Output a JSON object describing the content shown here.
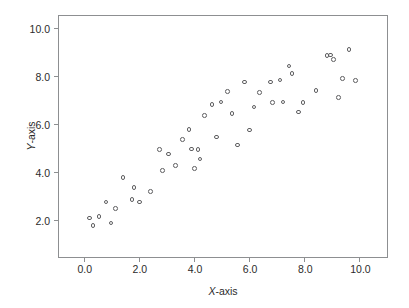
{
  "chart_data": {
    "type": "scatter",
    "title": "",
    "xlabel": "X-axis",
    "ylabel": "Y-axis",
    "xlim": [
      -0.9,
      11.0
    ],
    "ylim": [
      0.45,
      10.5
    ],
    "grid": false,
    "legend": null,
    "marker": {
      "shape": "open-circle",
      "edge_color": "#5e5e60",
      "fill": "none",
      "size_px": 4.6
    },
    "frame_color": "#8d8f91",
    "background": "#ffffff",
    "xticks": [
      0.0,
      2.0,
      4.0,
      6.0,
      8.0,
      10.0
    ],
    "xtick_labels": [
      "0.0",
      "2.0",
      "4.0",
      "6.0",
      "8.0",
      "10.0"
    ],
    "yticks": [
      2.0,
      4.0,
      6.0,
      8.0,
      10.0
    ],
    "ytick_labels": [
      "2.0",
      "4.0",
      "6.0",
      "8.0",
      "10.0"
    ],
    "n_points": 48,
    "points": [
      {
        "x": 0.2,
        "y": 2.08
      },
      {
        "x": 0.33,
        "y": 1.77
      },
      {
        "x": 0.55,
        "y": 2.15
      },
      {
        "x": 0.8,
        "y": 2.74
      },
      {
        "x": 0.98,
        "y": 1.86
      },
      {
        "x": 1.15,
        "y": 2.47
      },
      {
        "x": 1.42,
        "y": 3.77
      },
      {
        "x": 1.75,
        "y": 2.85
      },
      {
        "x": 1.82,
        "y": 3.36
      },
      {
        "x": 2.02,
        "y": 2.74
      },
      {
        "x": 2.42,
        "y": 3.17
      },
      {
        "x": 2.75,
        "y": 4.94
      },
      {
        "x": 2.85,
        "y": 4.05
      },
      {
        "x": 3.08,
        "y": 4.74
      },
      {
        "x": 3.32,
        "y": 4.26
      },
      {
        "x": 3.58,
        "y": 5.35
      },
      {
        "x": 3.82,
        "y": 5.76
      },
      {
        "x": 3.9,
        "y": 4.95
      },
      {
        "x": 4.02,
        "y": 4.14
      },
      {
        "x": 4.15,
        "y": 4.94
      },
      {
        "x": 4.22,
        "y": 4.54
      },
      {
        "x": 4.38,
        "y": 6.34
      },
      {
        "x": 4.65,
        "y": 6.82
      },
      {
        "x": 4.82,
        "y": 5.45
      },
      {
        "x": 4.98,
        "y": 6.92
      },
      {
        "x": 5.22,
        "y": 7.34
      },
      {
        "x": 5.38,
        "y": 6.43
      },
      {
        "x": 5.58,
        "y": 5.12
      },
      {
        "x": 5.82,
        "y": 7.74
      },
      {
        "x": 6.02,
        "y": 5.75
      },
      {
        "x": 6.18,
        "y": 6.71
      },
      {
        "x": 6.38,
        "y": 7.31
      },
      {
        "x": 6.78,
        "y": 7.74
      },
      {
        "x": 6.85,
        "y": 6.9
      },
      {
        "x": 7.12,
        "y": 7.83
      },
      {
        "x": 7.22,
        "y": 6.92
      },
      {
        "x": 7.45,
        "y": 8.42
      },
      {
        "x": 7.55,
        "y": 8.1
      },
      {
        "x": 7.78,
        "y": 6.5
      },
      {
        "x": 7.95,
        "y": 6.9
      },
      {
        "x": 8.42,
        "y": 7.4
      },
      {
        "x": 8.82,
        "y": 8.85
      },
      {
        "x": 8.95,
        "y": 8.88
      },
      {
        "x": 9.05,
        "y": 8.68
      },
      {
        "x": 9.25,
        "y": 7.1
      },
      {
        "x": 9.38,
        "y": 7.9
      },
      {
        "x": 9.62,
        "y": 9.1
      },
      {
        "x": 9.85,
        "y": 7.8
      }
    ]
  }
}
